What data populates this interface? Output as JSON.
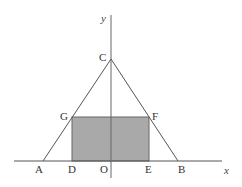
{
  "diagram": {
    "type": "geometry",
    "axes": {
      "x_label": "x",
      "y_label": "y"
    },
    "points": {
      "A": "A",
      "B": "B",
      "C": "C",
      "D": "D",
      "E": "E",
      "F": "F",
      "G": "G",
      "O": "O"
    },
    "colors": {
      "line": "#555555",
      "rect_fill": "#a9a9a9",
      "background": "#ffffff"
    }
  }
}
